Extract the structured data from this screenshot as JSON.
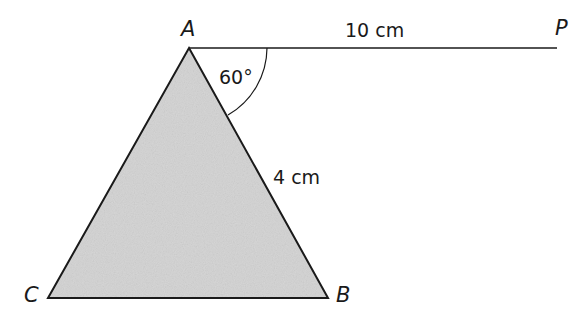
{
  "diagram": {
    "type": "geometry",
    "points": {
      "A": {
        "label": "A",
        "x": 189,
        "y": 48
      },
      "B": {
        "label": "B",
        "x": 328,
        "y": 298
      },
      "C": {
        "label": "C",
        "x": 48,
        "y": 298
      },
      "P": {
        "label": "P",
        "x": 557,
        "y": 48
      }
    },
    "segments": [
      {
        "from": "A",
        "to": "P",
        "label": "10 cm"
      },
      {
        "from": "A",
        "to": "B",
        "label": "4 cm"
      },
      {
        "from": "A",
        "to": "C",
        "label": ""
      },
      {
        "from": "C",
        "to": "B",
        "label": ""
      }
    ],
    "angle": {
      "vertex": "A",
      "between": [
        "P",
        "B"
      ],
      "label": "60°"
    },
    "shaded_region": "triangle ABC",
    "colors": {
      "fill": "#d6d6d6",
      "stroke": "#1a1a1a"
    }
  }
}
